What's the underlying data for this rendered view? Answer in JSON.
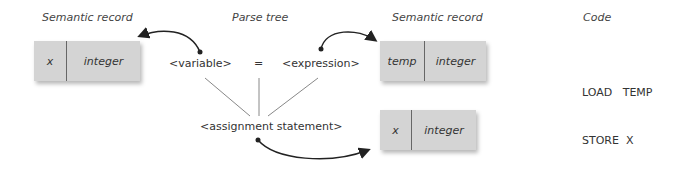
{
  "headings": {
    "semantic_left": "Semantic record",
    "parse_tree": "Parse tree",
    "semantic_right": "Semantic record",
    "code": "Code"
  },
  "parse_tree": {
    "variable": "<variable>",
    "equals": "=",
    "expression": "<expression>",
    "assignment": "<assignment statement>"
  },
  "records": [
    {
      "name": "x",
      "type": "integer"
    },
    {
      "name": "temp",
      "type": "integer"
    },
    {
      "name": "x",
      "type": "integer"
    }
  ],
  "code": {
    "line1": "LOAD   TEMP",
    "line2": "STORE  X"
  },
  "colors": {
    "record_fill": "#d4d4d4",
    "arrow": "#222222",
    "tree_line": "#777777"
  }
}
